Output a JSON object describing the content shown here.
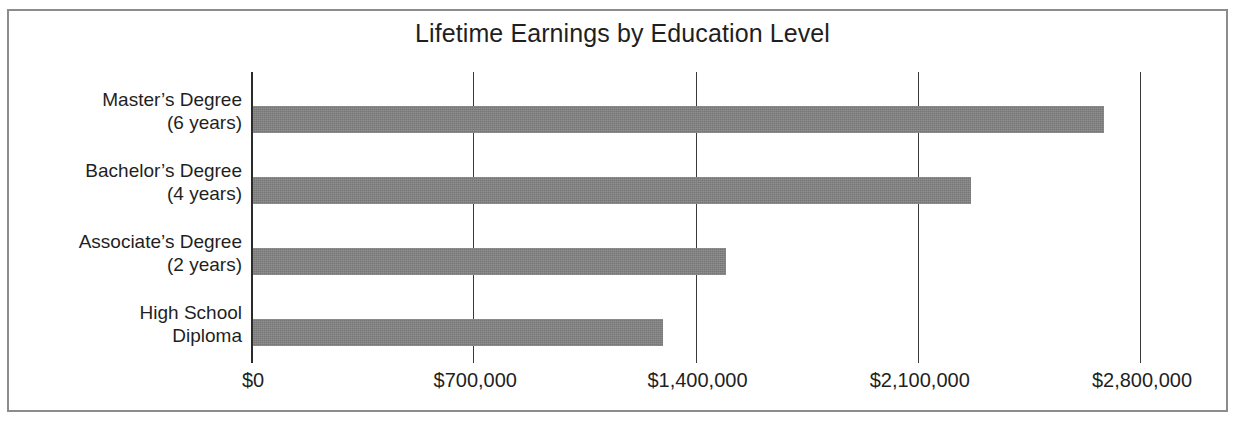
{
  "chart_data": {
    "type": "bar",
    "orientation": "horizontal",
    "title": "Lifetime Earnings by Education Level",
    "xlabel": "",
    "ylabel": "",
    "categories": [
      "Master’s Degree\n(6 years)",
      "Bachelor’s Degree\n(4 years)",
      "Associate’s Degree\n(2 years)",
      "High School\nDiploma"
    ],
    "category_lines": [
      [
        "Master’s Degree",
        "(6 years)"
      ],
      [
        "Bachelor’s Degree",
        "(4 years)"
      ],
      [
        "Associate’s Degree",
        "(2 years)"
      ],
      [
        "High School",
        "Diploma"
      ]
    ],
    "values": [
      2680000,
      2260000,
      1490000,
      1290000
    ],
    "xlim": [
      0,
      2800000
    ],
    "xticks": [
      0,
      700000,
      1400000,
      2100000,
      2800000
    ],
    "xtick_labels": [
      "$0",
      "$700,000",
      "$1,400,000",
      "$2,100,000",
      "$2,800,000"
    ],
    "grid": true,
    "legend": null,
    "bar_color": "#828282",
    "axis_color": "#2b2b2b",
    "frame_color": "#8c8c8c",
    "background": "#ffffff"
  }
}
